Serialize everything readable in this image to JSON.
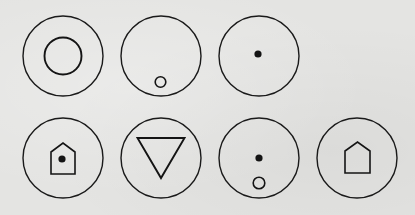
{
  "figure": {
    "stroke_color": "#1a1a1a",
    "background_color": "#e4e4e2",
    "rows": [
      {
        "row": 1,
        "symbols": [
          {
            "id": "sym-1",
            "name": "concentric-circle",
            "outer": {
              "cx": 63,
              "cy": 56,
              "r": 40
            }
          },
          {
            "id": "sym-2",
            "name": "small-circle-bottom",
            "outer": {
              "cx": 161,
              "cy": 56,
              "r": 40
            }
          },
          {
            "id": "sym-3",
            "name": "center-dot",
            "outer": {
              "cx": 259,
              "cy": 56,
              "r": 40
            }
          }
        ]
      },
      {
        "row": 2,
        "symbols": [
          {
            "id": "sym-4",
            "name": "house-with-dot",
            "outer": {
              "cx": 63,
              "cy": 158,
              "r": 40
            }
          },
          {
            "id": "sym-5",
            "name": "inverted-triangle",
            "outer": {
              "cx": 161,
              "cy": 158,
              "r": 40
            }
          },
          {
            "id": "sym-6",
            "name": "dot-above-circle",
            "outer": {
              "cx": 259,
              "cy": 158,
              "r": 40
            }
          },
          {
            "id": "sym-7",
            "name": "house-outline",
            "outer": {
              "cx": 357,
              "cy": 158,
              "r": 40
            }
          }
        ]
      }
    ]
  }
}
